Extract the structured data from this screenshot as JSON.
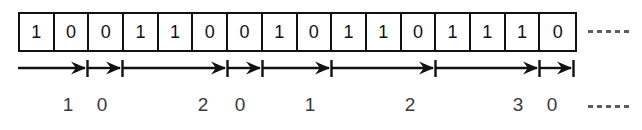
{
  "diagram": {
    "colors": {
      "ink": "#111111",
      "label_ink": "#3a3a3a",
      "dash": "#5d5d5d",
      "background": "#ffffff"
    },
    "bit_strip": {
      "name": "bit-cell-strip",
      "cell_count": 16,
      "bits": [
        "1",
        "0",
        "0",
        "1",
        "1",
        "0",
        "0",
        "1",
        "0",
        "1",
        "1",
        "0",
        "1",
        "1",
        "1",
        "0"
      ],
      "bit_string": "1001100101101110",
      "continuation": "-----",
      "continuation_dash_count": 5
    },
    "runs": {
      "name": "run-length-arrow-row",
      "continuation": "-----",
      "continuation_dash_count": 5,
      "items": [
        {
          "label": "1",
          "bits": "10",
          "start_cell": 1,
          "end_cell": 2,
          "x1": 18,
          "x2": 86,
          "label_x": 68
        },
        {
          "label": "0",
          "bits": "0",
          "start_cell": 3,
          "end_cell": 3,
          "x1": 88,
          "x2": 121,
          "label_x": 102
        },
        {
          "label": "2",
          "bits": "1100",
          "start_cell": 4,
          "end_cell": 7,
          "x1": 123,
          "x2": 226,
          "label_x": 203
        },
        {
          "label": "0",
          "bits": "1",
          "start_cell": 8,
          "end_cell": 8,
          "x1": 228,
          "x2": 261,
          "label_x": 240
        },
        {
          "label": "1",
          "bits": "01",
          "start_cell": 9,
          "end_cell": 10,
          "x1": 263,
          "x2": 330,
          "label_x": 310
        },
        {
          "label": "2",
          "bits": "101",
          "start_cell": 11,
          "end_cell": 13,
          "x1": 332,
          "x2": 434,
          "label_x": 410
        },
        {
          "label": "3",
          "bits": "111",
          "start_cell": 14,
          "end_cell": 15,
          "x1": 436,
          "x2": 538,
          "label_x": 518
        },
        {
          "label": "0",
          "bits": "0",
          "start_cell": 16,
          "end_cell": 16,
          "x1": 540,
          "x2": 572,
          "label_x": 552
        }
      ]
    }
  }
}
